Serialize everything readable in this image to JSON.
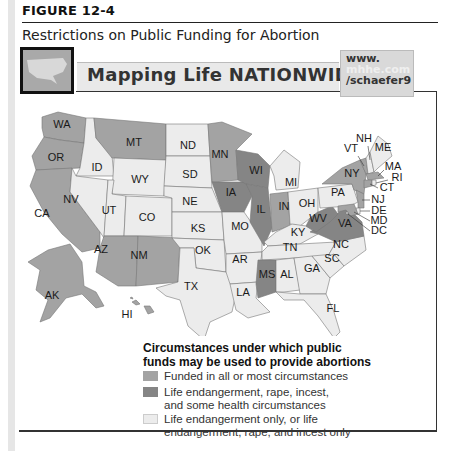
{
  "figure": {
    "number": "FIGURE 12-4",
    "title": "Restrictions on Public Funding for Abortion"
  },
  "banner": {
    "text": "Mapping Life NATIONWIDE",
    "url_line1": "www.",
    "url_line2": "mhhe.com",
    "url_line3": "/schaefer9"
  },
  "colors": {
    "funded_all": "#a3a3a3",
    "life_rape_incest_health": "#858585",
    "life_only": "#ececec",
    "border": "#777777"
  },
  "legend": {
    "title_line1": "Circumstances under which public",
    "title_line2": "funds may be used to provide abortions",
    "items": [
      {
        "key": "funded_all",
        "line1": "Funded in all or most circumstances",
        "line2": ""
      },
      {
        "key": "life_rape_incest_health",
        "line1": "Life endangerment, rape, incest,",
        "line2": "and some health circumstances"
      },
      {
        "key": "life_only",
        "line1": "Life endangerment only, or life",
        "line2": "endangerment, rape, and incest only"
      }
    ]
  },
  "states": {
    "funded_all": [
      "WA",
      "OR",
      "CA",
      "MT",
      "AZ",
      "NM",
      "MN",
      "IN",
      "AK",
      "HI",
      "NY",
      "VT",
      "NJ",
      "CT",
      "MA",
      "MD"
    ],
    "life_rape_incest_health": [
      "WI",
      "IA",
      "IL",
      "WV",
      "VA",
      "MS"
    ],
    "life_only": [
      "ID",
      "NV",
      "UT",
      "WY",
      "CO",
      "ND",
      "SD",
      "NE",
      "KS",
      "OK",
      "TX",
      "MO",
      "AR",
      "LA",
      "MI",
      "OH",
      "KY",
      "TN",
      "AL",
      "GA",
      "SC",
      "NC",
      "FL",
      "PA",
      "NH",
      "ME",
      "RI",
      "DE",
      "DC"
    ]
  },
  "labels": {
    "WA": "WA",
    "OR": "OR",
    "CA": "CA",
    "ID": "ID",
    "NV": "NV",
    "MT": "MT",
    "WY": "WY",
    "UT": "UT",
    "CO": "CO",
    "AZ": "AZ",
    "NM": "NM",
    "ND": "ND",
    "SD": "SD",
    "NE": "NE",
    "KS": "KS",
    "OK": "OK",
    "TX": "TX",
    "MN": "MN",
    "IA": "IA",
    "MO": "MO",
    "AR": "AR",
    "LA": "LA",
    "WI": "WI",
    "IL": "IL",
    "MI": "MI",
    "IN": "IN",
    "OH": "OH",
    "KY": "KY",
    "TN": "TN",
    "MS": "MS",
    "AL": "AL",
    "GA": "GA",
    "FL": "FL",
    "SC": "SC",
    "NC": "NC",
    "VA": "VA",
    "WV": "WV",
    "PA": "PA",
    "NY": "NY",
    "VT": "VT",
    "NH": "NH",
    "ME": "ME",
    "MA": "MA",
    "RI": "RI",
    "CT": "CT",
    "NJ": "NJ",
    "DE": "DE",
    "MD": "MD",
    "DC": "DC",
    "AK": "AK",
    "HI": "HI"
  }
}
